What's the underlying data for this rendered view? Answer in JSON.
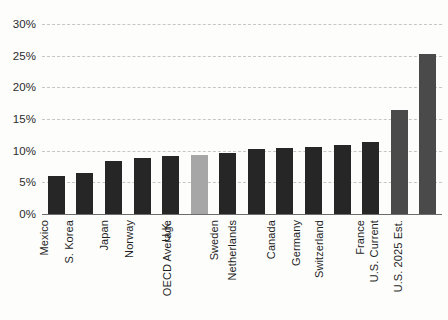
{
  "chart_data": {
    "type": "bar",
    "title": "",
    "subtitle": "",
    "xlabel": "",
    "ylabel": "",
    "ylim": [
      0,
      30
    ],
    "ytick_labels": [
      "30%",
      "25%",
      "20%",
      "15%",
      "10%",
      "5%",
      "0%"
    ],
    "ytick_values": [
      30,
      25,
      20,
      15,
      10,
      5,
      0
    ],
    "grid": true,
    "legend": "none",
    "categories": [
      "Mexico",
      "S. Korea",
      "Japan",
      "Norway",
      "U.K.",
      "OECD Average",
      "Sweden",
      "Netherlands",
      "Canada",
      "Germany",
      "Switzerland",
      "France",
      "U.S. Current",
      "U.S. 2025 Est."
    ],
    "values": [
      6.0,
      6.5,
      8.4,
      8.8,
      9.1,
      9.3,
      9.7,
      10.2,
      10.4,
      10.6,
      10.9,
      11.4,
      16.5,
      25.3
    ],
    "bar_styles": [
      "default",
      "default",
      "default",
      "default",
      "default",
      "accent",
      "default",
      "default",
      "default",
      "default",
      "default",
      "default",
      "us",
      "us"
    ],
    "colors": {
      "bar_default": "#262626",
      "bar_accent": "#a6a6a6",
      "bar_us": "#4a4a4a",
      "gridline": "#c6c6c6",
      "axis": "#6d6d6d",
      "text": "#1f1f1f",
      "background": "#fdfdfc"
    }
  }
}
